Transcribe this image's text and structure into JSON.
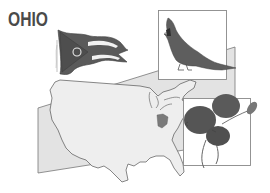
{
  "title": "OHIO",
  "illustration": {
    "flag": {
      "name": "Ohio state flag",
      "icon": "flag-icon"
    },
    "bird": {
      "name": "Cardinal",
      "icon": "bird-icon"
    },
    "flower": {
      "name": "Scarlet carnation",
      "icon": "flower-icon"
    },
    "map": {
      "name": "United States map",
      "highlighted_state": "Ohio",
      "icon": "map-icon"
    }
  },
  "colors": {
    "title": "#4a4a4a",
    "panel_fill": "#e3e3e3",
    "panel_stroke": "#777777",
    "map_fill": "#eeeeee",
    "map_stroke": "#555555",
    "highlight": "#7a7a7a",
    "dark": "#555555"
  }
}
